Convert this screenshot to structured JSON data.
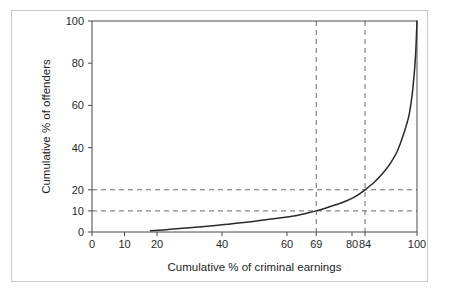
{
  "figure": {
    "caption_fragment": "",
    "border_color": "#c9c9c9"
  },
  "chart_data": {
    "type": "line",
    "title": "",
    "subtitle": "",
    "xlabel": "Cumulative % of criminal earnings",
    "ylabel": "Cumulative % of offenders",
    "xlim": [
      0,
      100
    ],
    "ylim": [
      0,
      100
    ],
    "grid": false,
    "legend": null,
    "legend_position": "none",
    "xticks": [
      0,
      10,
      20,
      40,
      60,
      69,
      80,
      84,
      100
    ],
    "xticklabels": [
      "0",
      "10",
      "20",
      "40",
      "60",
      "69",
      "80",
      "84",
      "100"
    ],
    "yticks": [
      0,
      10,
      20,
      40,
      60,
      80,
      100
    ],
    "yticklabels": [
      "0",
      "10",
      "20",
      "40",
      "60",
      "80",
      "100"
    ],
    "series": [
      {
        "name": "Cumulative concentration curve",
        "color": "#2a2a2a",
        "style": "solid",
        "x": [
          18,
          22,
          26,
          30,
          34,
          38,
          42,
          46,
          50,
          54,
          58,
          62,
          66,
          69,
          72,
          75,
          78,
          81,
          84,
          87,
          90,
          92,
          94,
          96,
          97.5,
          98.5,
          99.2,
          99.6,
          99.9,
          100
        ],
        "y": [
          0.6,
          1.0,
          1.5,
          2.0,
          2.5,
          3.1,
          3.7,
          4.4,
          5.1,
          5.9,
          6.7,
          7.6,
          8.9,
          10.0,
          11.4,
          12.9,
          14.6,
          16.8,
          20.0,
          23.8,
          28.8,
          33.0,
          38.5,
          47.0,
          55.0,
          65.0,
          76.0,
          85.0,
          96.0,
          100
        ]
      }
    ],
    "annotations": [
      {
        "name": "reference-vertical-69",
        "orientation": "vertical",
        "value": 69,
        "style": "dashed",
        "color": "#6b6b6b"
      },
      {
        "name": "reference-vertical-84",
        "orientation": "vertical",
        "value": 84,
        "style": "dashed",
        "color": "#6b6b6b"
      },
      {
        "name": "reference-horizontal-10",
        "orientation": "horizontal",
        "value": 10,
        "style": "dashed",
        "color": "#6b6b6b"
      },
      {
        "name": "reference-horizontal-20",
        "orientation": "horizontal",
        "value": 20,
        "style": "dashed",
        "color": "#6b6b6b"
      }
    ],
    "reference_points": [
      {
        "x": 69,
        "y": 10
      },
      {
        "x": 84,
        "y": 20
      }
    ]
  }
}
